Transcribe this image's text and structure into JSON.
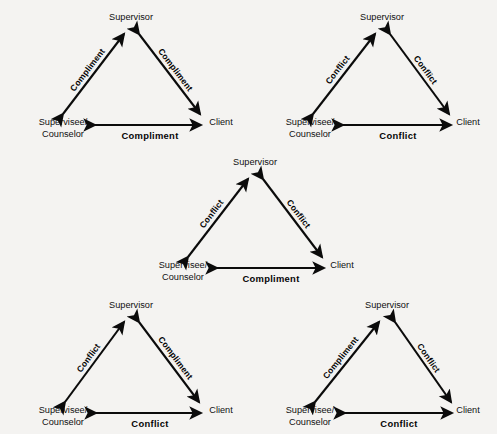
{
  "page": {
    "background_color": "#f4f3f1",
    "ink_color": "#0b0b0b",
    "width": 497,
    "height": 434
  },
  "labels": {
    "supervisor": "Supervisor",
    "supervisee_line1": "Supervisee/",
    "supervisee_line2": "Counselor",
    "client": "Client",
    "compliment": "Compliment",
    "conflict": "Conflict"
  },
  "diagrams": [
    {
      "id": "diagram-top-left",
      "position": "top-left",
      "nodes": {
        "apex": "Supervisor",
        "left_line1": "Supervisee/",
        "left_line2": "Counselor",
        "right": "Client"
      },
      "edges": {
        "left_edge": "Compliment",
        "right_edge": "Compliment",
        "base_edge": "Compliment"
      }
    },
    {
      "id": "diagram-top-right",
      "position": "top-right",
      "nodes": {
        "apex": "Supervisor",
        "left_line1": "Supervisee/",
        "left_line2": "Counselor",
        "right": "Client"
      },
      "edges": {
        "left_edge": "Conflict",
        "right_edge": "Conflict",
        "base_edge": "Conflict"
      }
    },
    {
      "id": "diagram-middle",
      "position": "middle-center",
      "nodes": {
        "apex": "Supervisor",
        "left_line1": "Supervisee/",
        "left_line2": "Counselor",
        "right": "Client"
      },
      "edges": {
        "left_edge": "Conflict",
        "right_edge": "Conflict",
        "base_edge": "Compliment"
      }
    },
    {
      "id": "diagram-bottom-left",
      "position": "bottom-left",
      "nodes": {
        "apex": "Supervisor",
        "left_line1": "Supervisee/",
        "left_line2": "Counselor",
        "right": "Client"
      },
      "edges": {
        "left_edge": "Conflict",
        "right_edge": "Compliment",
        "base_edge": "Conflict"
      }
    },
    {
      "id": "diagram-bottom-right",
      "position": "bottom-right",
      "nodes": {
        "apex": "Supervisor",
        "left_line1": "Supervisee/",
        "left_line2": "Counselor",
        "right": "Client"
      },
      "edges": {
        "left_edge": "Compliment",
        "right_edge": "Conflict",
        "base_edge": "Conflict"
      }
    }
  ]
}
